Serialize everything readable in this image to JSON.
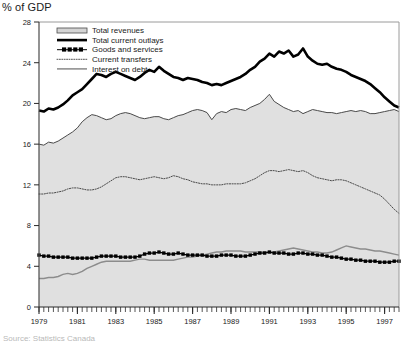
{
  "axis_title": "% of GDP",
  "footnote": "Source: Statistics Canada",
  "legend": {
    "items": [
      {
        "label": "Total revenues",
        "style": "area-swatch",
        "color": "#d4d4d4"
      },
      {
        "label": "Total current outlays",
        "style": "thick-line",
        "color": "#000000"
      },
      {
        "label": "Goods and services",
        "style": "marker-line",
        "color": "#000000"
      },
      {
        "label": "Current transfers",
        "style": "dotted-line",
        "color": "#555555"
      },
      {
        "label": "Interest on debt",
        "style": "gray-line",
        "color": "#808080"
      }
    ]
  },
  "chart_data": {
    "type": "line",
    "title": "",
    "subtitle": "",
    "xlabel": "",
    "ylabel": "% of GDP",
    "xlim": [
      1979.0,
      1997.75
    ],
    "ylim": [
      0,
      28
    ],
    "yticks": [
      0,
      4,
      8,
      12,
      16,
      20,
      24,
      28
    ],
    "xticks": [
      1979,
      1981,
      1983,
      1985,
      1987,
      1989,
      1991,
      1993,
      1995,
      1997
    ],
    "xtick_labels": [
      "1979",
      "1981",
      "1983",
      "1985",
      "1987",
      "1989",
      "1991",
      "1993",
      "1995",
      "1997"
    ],
    "minor_x_interval_quarters": 1,
    "grid": false,
    "legend_position": "top-left-inside",
    "x": [
      1979.0,
      1979.25,
      1979.5,
      1979.75,
      1980.0,
      1980.25,
      1980.5,
      1980.75,
      1981.0,
      1981.25,
      1981.5,
      1981.75,
      1982.0,
      1982.25,
      1982.5,
      1982.75,
      1983.0,
      1983.25,
      1983.5,
      1983.75,
      1984.0,
      1984.25,
      1984.5,
      1984.75,
      1985.0,
      1985.25,
      1985.5,
      1985.75,
      1986.0,
      1986.25,
      1986.5,
      1986.75,
      1987.0,
      1987.25,
      1987.5,
      1987.75,
      1988.0,
      1988.25,
      1988.5,
      1988.75,
      1989.0,
      1989.25,
      1989.5,
      1989.75,
      1990.0,
      1990.25,
      1990.5,
      1990.75,
      1991.0,
      1991.25,
      1991.5,
      1991.75,
      1992.0,
      1992.25,
      1992.5,
      1992.75,
      1993.0,
      1993.25,
      1993.5,
      1993.75,
      1994.0,
      1994.25,
      1994.5,
      1994.75,
      1995.0,
      1995.25,
      1995.5,
      1995.75,
      1996.0,
      1996.25,
      1996.5,
      1996.75,
      1997.0,
      1997.25,
      1997.5,
      1997.75
    ],
    "series": [
      {
        "name": "Total revenues",
        "render": "area",
        "values": [
          16.0,
          15.9,
          16.2,
          16.1,
          16.3,
          16.6,
          16.9,
          17.2,
          17.6,
          18.2,
          18.6,
          18.9,
          18.8,
          18.6,
          18.4,
          18.5,
          18.8,
          19.0,
          19.1,
          19.0,
          18.8,
          18.6,
          18.5,
          18.6,
          18.7,
          18.7,
          18.5,
          18.4,
          18.6,
          18.8,
          18.9,
          19.1,
          19.3,
          19.4,
          19.3,
          19.1,
          18.4,
          19.0,
          19.2,
          19.1,
          19.4,
          19.5,
          19.4,
          19.3,
          19.6,
          19.8,
          20.0,
          20.4,
          20.9,
          20.2,
          19.9,
          19.6,
          19.4,
          19.2,
          19.3,
          19.0,
          19.2,
          19.4,
          19.3,
          19.2,
          19.1,
          19.1,
          19.0,
          19.1,
          19.2,
          19.3,
          19.2,
          19.3,
          19.2,
          19.0,
          19.0,
          19.1,
          19.2,
          19.3,
          19.4,
          19.2
        ]
      },
      {
        "name": "Total current outlays",
        "render": "thick-line",
        "values": [
          19.3,
          19.2,
          19.5,
          19.4,
          19.6,
          19.9,
          20.3,
          20.8,
          21.1,
          21.4,
          21.9,
          22.4,
          22.9,
          22.8,
          22.6,
          22.9,
          23.1,
          22.9,
          22.7,
          22.5,
          22.3,
          22.6,
          23.0,
          23.3,
          23.1,
          23.6,
          23.2,
          22.9,
          22.6,
          22.5,
          22.3,
          22.5,
          22.4,
          22.3,
          22.1,
          22.0,
          21.8,
          21.9,
          21.8,
          22.0,
          22.2,
          22.4,
          22.6,
          22.9,
          23.3,
          23.6,
          24.1,
          24.4,
          24.9,
          24.6,
          25.1,
          24.9,
          25.2,
          24.6,
          24.8,
          25.4,
          24.6,
          24.2,
          23.9,
          23.8,
          23.9,
          23.6,
          23.4,
          23.3,
          23.1,
          22.8,
          22.6,
          22.4,
          22.2,
          21.9,
          21.5,
          21.1,
          20.6,
          20.2,
          19.8,
          19.6
        ]
      },
      {
        "name": "Goods and services",
        "render": "marker-line",
        "values": [
          5.1,
          5.0,
          5.0,
          4.9,
          4.9,
          4.9,
          4.9,
          4.8,
          4.8,
          4.8,
          4.8,
          4.8,
          4.9,
          5.0,
          5.0,
          5.0,
          5.0,
          4.9,
          4.9,
          4.9,
          4.9,
          5.0,
          5.2,
          5.3,
          5.3,
          5.4,
          5.3,
          5.2,
          5.2,
          5.3,
          5.2,
          5.1,
          5.1,
          5.1,
          5.1,
          5.0,
          5.0,
          5.0,
          5.1,
          5.1,
          5.1,
          5.0,
          5.0,
          5.0,
          5.1,
          5.2,
          5.3,
          5.3,
          5.4,
          5.3,
          5.3,
          5.3,
          5.2,
          5.2,
          5.3,
          5.3,
          5.2,
          5.2,
          5.1,
          5.1,
          5.0,
          4.9,
          4.9,
          4.8,
          4.7,
          4.7,
          4.6,
          4.6,
          4.5,
          4.5,
          4.5,
          4.4,
          4.4,
          4.4,
          4.5,
          4.5
        ]
      },
      {
        "name": "Current transfers",
        "render": "dotted-line",
        "values": [
          11.1,
          11.1,
          11.2,
          11.2,
          11.3,
          11.4,
          11.6,
          11.7,
          11.7,
          11.6,
          11.5,
          11.5,
          11.6,
          11.8,
          12.1,
          12.4,
          12.7,
          12.8,
          12.8,
          12.7,
          12.6,
          12.5,
          12.6,
          12.7,
          12.8,
          12.7,
          12.6,
          12.7,
          12.9,
          12.8,
          12.6,
          12.5,
          12.3,
          12.2,
          12.1,
          12.1,
          12.0,
          12.0,
          12.0,
          12.1,
          12.1,
          12.1,
          12.1,
          12.2,
          12.4,
          12.6,
          12.9,
          13.2,
          13.4,
          13.4,
          13.3,
          13.4,
          13.5,
          13.4,
          13.3,
          13.4,
          13.2,
          12.9,
          12.7,
          12.6,
          12.5,
          12.4,
          12.5,
          12.5,
          12.4,
          12.2,
          12.0,
          11.8,
          11.6,
          11.4,
          11.2,
          11.0,
          10.6,
          10.1,
          9.6,
          9.2
        ]
      },
      {
        "name": "Interest on debt",
        "render": "gray-line",
        "values": [
          2.8,
          2.8,
          2.9,
          2.9,
          3.0,
          3.2,
          3.3,
          3.2,
          3.3,
          3.5,
          3.8,
          4.0,
          4.2,
          4.4,
          4.5,
          4.5,
          4.5,
          4.5,
          4.5,
          4.5,
          4.6,
          4.7,
          4.7,
          4.6,
          4.6,
          4.6,
          4.6,
          4.6,
          4.6,
          4.7,
          4.8,
          4.9,
          4.9,
          5.0,
          5.1,
          5.2,
          5.3,
          5.4,
          5.4,
          5.5,
          5.5,
          5.5,
          5.5,
          5.4,
          5.4,
          5.4,
          5.4,
          5.4,
          5.4,
          5.4,
          5.5,
          5.6,
          5.7,
          5.8,
          5.7,
          5.6,
          5.5,
          5.4,
          5.4,
          5.3,
          5.3,
          5.4,
          5.6,
          5.8,
          6.0,
          5.9,
          5.8,
          5.7,
          5.7,
          5.6,
          5.5,
          5.5,
          5.4,
          5.3,
          5.2,
          5.1
        ]
      }
    ]
  }
}
